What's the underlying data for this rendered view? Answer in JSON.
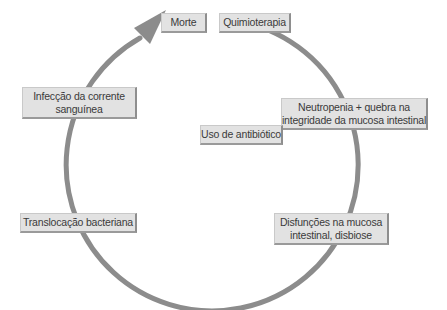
{
  "diagram": {
    "type": "cycle",
    "colors": {
      "arc": "#8c8c8c",
      "box_fill": "#e2e2e2",
      "box_shadow": "#8e8e8e",
      "text": "#3a3a3a"
    },
    "nodes": [
      {
        "id": "morte",
        "label": "Morte"
      },
      {
        "id": "quimioterapia",
        "label": "Quimioterapia"
      },
      {
        "id": "infeccao",
        "line1": "Infecção da corrente",
        "line2": "sanguínea"
      },
      {
        "id": "neutropenia",
        "line1": "Neutropenia + quebra na",
        "line2": "integridade da mucosa intestinal"
      },
      {
        "id": "antibiotico",
        "label": "Uso de antibiótico"
      },
      {
        "id": "translocacao",
        "label": "Translocação bacteriana"
      },
      {
        "id": "disfuncoes",
        "line1": "Disfunções na mucosa",
        "line2": "intestinal, disbiose"
      }
    ]
  }
}
